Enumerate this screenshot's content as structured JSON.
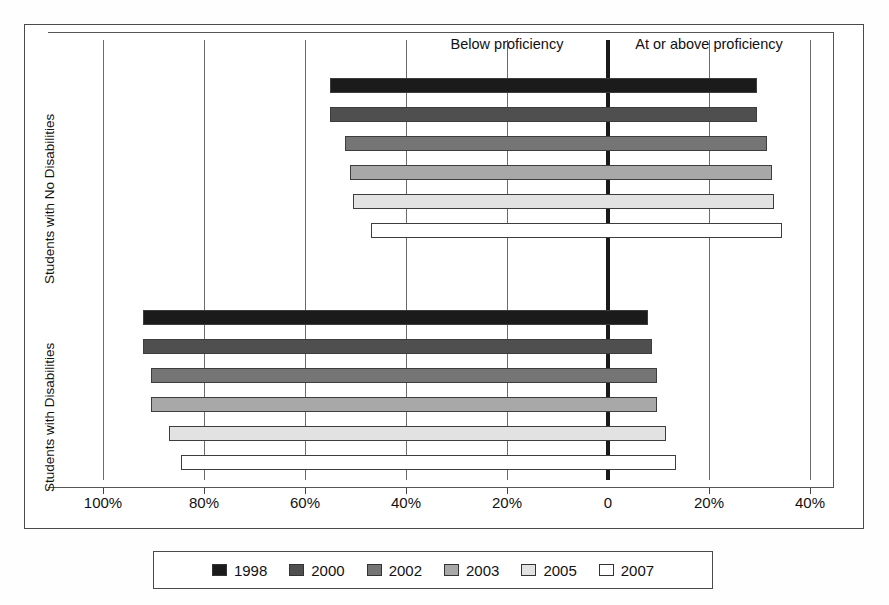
{
  "chart_data": {
    "type": "bar",
    "orientation": "horizontal",
    "title": "",
    "subtitle": "",
    "xlabel": "",
    "ylabel": "",
    "annotations": [
      {
        "text": "Below proficiency",
        "x_percent_below": 20
      },
      {
        "text": "At or above proficiency",
        "x_percent_above": 20
      }
    ],
    "axis": {
      "tick_labels": [
        "100%",
        "80%",
        "60%",
        "40%",
        "20%",
        "0",
        "20%",
        "40%"
      ],
      "tick_values": [
        -100,
        -80,
        -60,
        -40,
        -20,
        0,
        20,
        40
      ],
      "xlim": [
        -100,
        45
      ],
      "grid": true,
      "zero_line": true
    },
    "groups": [
      {
        "name": "Students with No Disabilities",
        "series": [
          {
            "name": "1998",
            "below": 55,
            "at_or_above": 29.5
          },
          {
            "name": "2000",
            "below": 55,
            "at_or_above": 29.5
          },
          {
            "name": "2002",
            "below": 52,
            "at_or_above": 31.5
          },
          {
            "name": "2003",
            "below": 51,
            "at_or_above": 32.5
          },
          {
            "name": "2005",
            "below": 50.5,
            "at_or_above": 32.8
          },
          {
            "name": "2007",
            "below": 47,
            "at_or_above": 34.5
          }
        ]
      },
      {
        "name": "Students with Disabilities",
        "series": [
          {
            "name": "1998",
            "below": 92,
            "at_or_above": 8.0
          },
          {
            "name": "2000",
            "below": 92,
            "at_or_above": 8.7
          },
          {
            "name": "2002",
            "below": 90.5,
            "at_or_above": 9.7
          },
          {
            "name": "2003",
            "below": 90.5,
            "at_or_above": 9.7
          },
          {
            "name": "2005",
            "below": 87,
            "at_or_above": 11.5
          },
          {
            "name": "2007",
            "below": 84.5,
            "at_or_above": 13.5
          }
        ]
      }
    ],
    "legend": {
      "position": "bottom",
      "entries": [
        {
          "label": "1998",
          "color": "#1b1b1b"
        },
        {
          "label": "2000",
          "color": "#4f4f4f"
        },
        {
          "label": "2002",
          "color": "#757575"
        },
        {
          "label": "2003",
          "color": "#a8a8a8"
        },
        {
          "label": "2005",
          "color": "#e2e2e2"
        },
        {
          "label": "2007",
          "color": "#ffffff"
        }
      ]
    }
  },
  "group_labels": {
    "top": "Students with No Disabilities",
    "bottom": "Students with Disabilities"
  },
  "headers": {
    "below": "Below proficiency",
    "above": "At or above proficiency"
  }
}
